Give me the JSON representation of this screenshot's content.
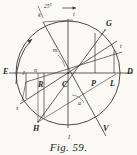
{
  "figure": {
    "caption": "Fig. 59.",
    "angle_annotation": "25°",
    "stroke_color": "#3a3531",
    "paper_color": "#fbfaf7",
    "circle": {
      "cx": 68,
      "cy": 73,
      "r": 52
    },
    "labels": {
      "E": "E",
      "J_left": "J",
      "D": "D",
      "L": "L",
      "G": "G",
      "C": "C",
      "R": "R",
      "P": "P",
      "H": "H",
      "V": "V",
      "I_bottom": "I",
      "S_lower_left": "s",
      "t_right": "t",
      "n_small": "n",
      "m_small": "m",
      "a_small": "a",
      "i_top": "i",
      "k_top": "k"
    },
    "label_positions": {
      "E": {
        "x": 3,
        "y": 74
      },
      "J_left": {
        "x": 22,
        "y": 75
      },
      "D": {
        "x": 127,
        "y": 74
      },
      "L": {
        "x": 112,
        "y": 85
      },
      "G": {
        "x": 108,
        "y": 25
      },
      "C": {
        "x": 64,
        "y": 86
      },
      "R": {
        "x": 39,
        "y": 86
      },
      "P": {
        "x": 92,
        "y": 85
      },
      "H": {
        "x": 34,
        "y": 129
      },
      "V": {
        "x": 104,
        "y": 130
      },
      "I_bottom": {
        "x": 70,
        "y": 138
      },
      "S_lower_left": {
        "x": 16,
        "y": 108
      },
      "t_right": {
        "x": 120,
        "y": 46
      },
      "n_small": {
        "x": 35,
        "y": 71
      },
      "m_small": {
        "x": 54,
        "y": 50
      },
      "a_small": {
        "x": 79,
        "y": 103
      },
      "i_top": {
        "x": 74,
        "y": 14
      },
      "k_top": {
        "x": 39,
        "y": 15
      }
    }
  }
}
